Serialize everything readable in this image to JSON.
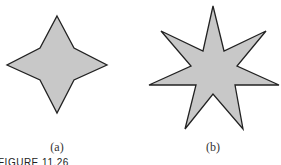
{
  "figure": {
    "caption": "FIGURE 11.26",
    "panels": [
      {
        "label": "(a)",
        "shape": "4-point star",
        "points": "57,16 74,48 107,65 74,80 57,113 40,80 7,65 40,48",
        "label_x": 57,
        "label_y": 140
      },
      {
        "label": "(b)",
        "shape": "7-point star",
        "points": "213,6 224,51 266,31 237,66 279,85 235,85 243,129 213,94 185,129 196,85 149,85 191,66 161,31 203,51",
        "label_x": 213,
        "label_y": 140
      }
    ],
    "colors": {
      "fill": "#c8c8c8",
      "stroke": "#222222"
    }
  }
}
